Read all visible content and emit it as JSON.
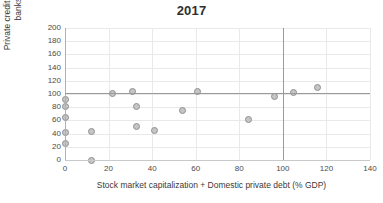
{
  "chart_data": {
    "type": "scatter",
    "title": "2017",
    "xlabel": "Stock market capitalization + Domestic private debt (% GDP)",
    "ylabel": "Private credit by deposit money banks (% GDP)",
    "xlim": [
      0,
      140
    ],
    "ylim": [
      0,
      200
    ],
    "xticks": [
      0,
      20,
      40,
      60,
      80,
      100,
      120,
      140
    ],
    "yticks": [
      0,
      20,
      40,
      60,
      80,
      100,
      120,
      140,
      160,
      180,
      200
    ],
    "grid": true,
    "legend": "none",
    "marker_fill": "#c5c5c5",
    "marker_edge": "#8f8f8f",
    "reference_lines": {
      "horizontal_y": 101,
      "vertical_x": 100,
      "color": "#9a9a9a"
    },
    "x": [
      0,
      0,
      0,
      0,
      0,
      12,
      12,
      22,
      31,
      33,
      33,
      41,
      54,
      61,
      84,
      96,
      105,
      116
    ],
    "y": [
      92,
      81,
      64,
      41,
      25,
      43,
      0,
      101,
      104,
      81,
      51,
      44,
      75,
      104,
      62,
      96,
      102,
      110
    ],
    "points": [
      {
        "x": 0,
        "y": 92
      },
      {
        "x": 0,
        "y": 81
      },
      {
        "x": 0,
        "y": 64
      },
      {
        "x": 0,
        "y": 41
      },
      {
        "x": 0,
        "y": 25
      },
      {
        "x": 12,
        "y": 43
      },
      {
        "x": 12,
        "y": 0
      },
      {
        "x": 22,
        "y": 101
      },
      {
        "x": 31,
        "y": 104
      },
      {
        "x": 33,
        "y": 81
      },
      {
        "x": 33,
        "y": 51
      },
      {
        "x": 41,
        "y": 44
      },
      {
        "x": 54,
        "y": 75
      },
      {
        "x": 61,
        "y": 104
      },
      {
        "x": 84,
        "y": 62
      },
      {
        "x": 96,
        "y": 96
      },
      {
        "x": 105,
        "y": 102
      },
      {
        "x": 116,
        "y": 110
      }
    ]
  }
}
